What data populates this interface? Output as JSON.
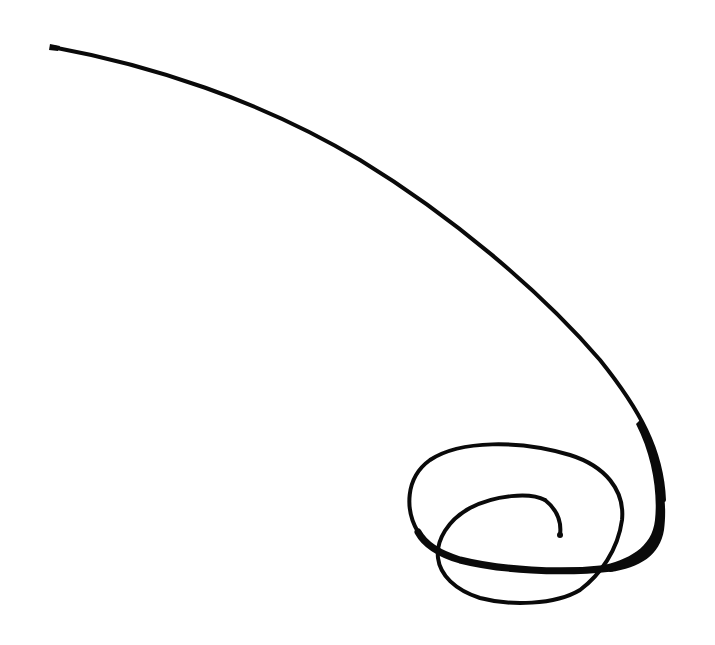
{
  "image": {
    "description": "Hand-drawn black ink calligraphic stroke ending in a spiral loop",
    "background_color": "#ffffff",
    "ink_color": "#0a0a0a"
  },
  "stroke": {
    "start_point": [
      52,
      47
    ],
    "spiral_center_approx": [
      515,
      520
    ],
    "end_point": [
      560,
      535
    ]
  }
}
